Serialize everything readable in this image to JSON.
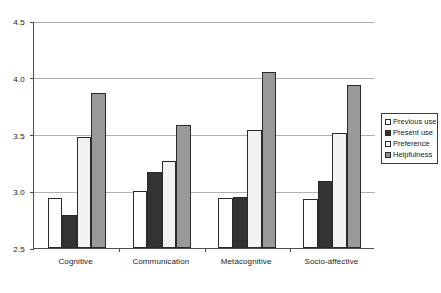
{
  "chart_data": {
    "type": "bar",
    "title": "",
    "subtitle": "",
    "xlabel": "",
    "ylabel": "",
    "categories": [
      "Cognitive",
      "Communication",
      "Metacognitive",
      "Socio-affective"
    ],
    "series": [
      {
        "name": "Previous use",
        "values": [
          2.94,
          3.0,
          2.94,
          2.93
        ],
        "color": "#ffffff",
        "swatch": "#ffffff"
      },
      {
        "name": "Present use",
        "values": [
          2.79,
          3.17,
          2.95,
          3.09
        ],
        "color": "#333333",
        "swatch": "#333333"
      },
      {
        "name": "Preference",
        "values": [
          3.48,
          3.27,
          3.54,
          3.51
        ],
        "color": "#f2f2f2",
        "swatch": "#f7f7f7"
      },
      {
        "name": "Helpfulness",
        "values": [
          3.87,
          3.58,
          4.05,
          3.94
        ],
        "color": "#999999",
        "swatch": "#8f8f8f"
      }
    ],
    "ylim": [
      2.5,
      4.5
    ],
    "ytick_values": [
      2.5,
      3.0,
      3.5,
      4.0,
      4.5
    ],
    "ytick_labels": [
      "2.5",
      "3.0",
      "3.5",
      "4.0",
      "4.5"
    ],
    "grid": true,
    "legend_position": "right",
    "border_color": "#2b2b2b",
    "axis_color": "#4d4d4d",
    "gridline_color": "#b0b0b0"
  }
}
